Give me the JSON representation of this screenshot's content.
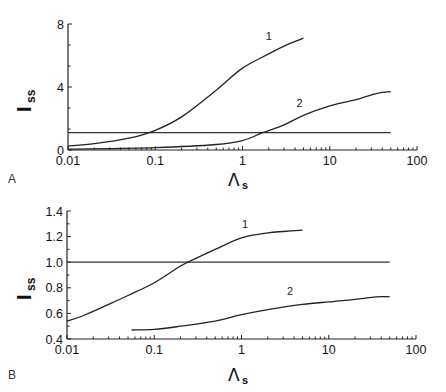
{
  "chart_data": [
    {
      "panel": "A",
      "type": "line",
      "xscale": "log",
      "xlabel": "Λs",
      "ylabel": "Iss",
      "xlim": [
        0.01,
        100
      ],
      "ylim": [
        0,
        8
      ],
      "xticks": [
        "0.01",
        "0.1",
        "1",
        "10",
        "100"
      ],
      "yticks": [
        "0",
        "4",
        "8"
      ],
      "reference_line": {
        "y": 1.1,
        "x_range": [
          0.01,
          50
        ]
      },
      "series": [
        {
          "name": "1",
          "x": [
            0.01,
            0.02,
            0.05,
            0.1,
            0.2,
            0.5,
            1,
            2,
            3,
            5
          ],
          "y": [
            0.25,
            0.4,
            0.75,
            1.25,
            2.1,
            3.8,
            5.2,
            6.1,
            6.6,
            7.1
          ]
        },
        {
          "name": "2",
          "x": [
            0.01,
            0.1,
            0.5,
            1,
            1.7,
            3,
            5,
            10,
            20,
            35,
            50
          ],
          "y": [
            0.05,
            0.15,
            0.35,
            0.6,
            1.1,
            1.6,
            2.2,
            2.8,
            3.2,
            3.6,
            3.7
          ]
        }
      ],
      "labels": [
        {
          "text": "1",
          "x": 2.0,
          "y": 7.0
        },
        {
          "text": "2",
          "x": 4.5,
          "y": 2.7
        }
      ]
    },
    {
      "panel": "B",
      "type": "line",
      "xscale": "log",
      "xlabel": "Λs",
      "ylabel": "Iss",
      "xlim": [
        0.01,
        100
      ],
      "ylim": [
        0.4,
        1.4
      ],
      "xticks": [
        "0.01",
        "0.1",
        "1",
        "10",
        "100"
      ],
      "yticks": [
        "0.4",
        "0.6",
        "0.8",
        "1.0",
        "1.2",
        "1.4"
      ],
      "reference_line": {
        "y": 1.0,
        "x_range": [
          0.01,
          50
        ]
      },
      "series": [
        {
          "name": "1",
          "x": [
            0.01,
            0.015,
            0.03,
            0.05,
            0.1,
            0.2,
            0.3,
            0.5,
            1,
            2,
            3,
            5
          ],
          "y": [
            0.54,
            0.58,
            0.67,
            0.74,
            0.84,
            0.97,
            1.03,
            1.1,
            1.19,
            1.23,
            1.24,
            1.25
          ]
        },
        {
          "name": "2",
          "x": [
            0.055,
            0.1,
            0.2,
            0.5,
            1,
            2,
            5,
            10,
            20,
            35,
            50
          ],
          "y": [
            0.47,
            0.475,
            0.5,
            0.54,
            0.59,
            0.63,
            0.67,
            0.69,
            0.71,
            0.73,
            0.73
          ]
        }
      ],
      "labels": [
        {
          "text": "1",
          "x": 1.1,
          "y": 1.27
        },
        {
          "text": "2",
          "x": 3.6,
          "y": 0.74
        }
      ]
    }
  ],
  "panels": {
    "a": {
      "letter": "A",
      "ylabel_main": "I",
      "ylabel_sub": "ss",
      "xlabel_main": "Λ",
      "xlabel_sub": "s"
    },
    "b": {
      "letter": "B",
      "ylabel_main": "I",
      "ylabel_sub": "ss",
      "xlabel_main": "Λ",
      "xlabel_sub": "s"
    }
  }
}
